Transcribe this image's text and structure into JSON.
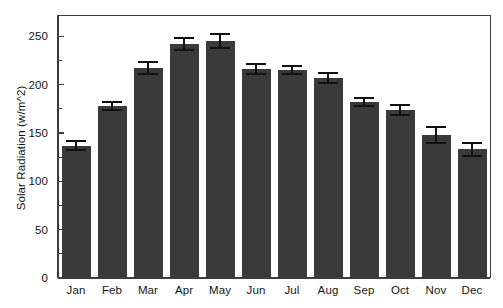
{
  "chart_data": {
    "type": "bar",
    "title": "",
    "xlabel": "",
    "ylabel": "Solar Radiation (w/m^2)",
    "categories": [
      "Jan",
      "Feb",
      "Mar",
      "Apr",
      "May",
      "Jun",
      "Jul",
      "Aug",
      "Sep",
      "Oct",
      "Nov",
      "Dec"
    ],
    "values": [
      137,
      178,
      217,
      242,
      245,
      216,
      215,
      207,
      182,
      174,
      148,
      133
    ],
    "errors": [
      5,
      4,
      6,
      6,
      7,
      5,
      4,
      5,
      4,
      5,
      8,
      7
    ],
    "ylim": [
      0,
      272
    ],
    "yticks": [
      0,
      50,
      100,
      150,
      200,
      250
    ],
    "ytick_labels": [
      "0",
      "50",
      "100",
      "150",
      "200",
      "250"
    ],
    "grid": false,
    "legend": null,
    "bar_color": "#3a3a3a",
    "errorbar_color": "#111111",
    "axis_color": "#3c3c3c",
    "background_color": "#ffffff",
    "series": [
      {
        "name": "Solar Radiation",
        "values": [
          137,
          178,
          217,
          242,
          245,
          216,
          215,
          207,
          182,
          174,
          148,
          133
        ],
        "errors": [
          5,
          4,
          6,
          6,
          7,
          5,
          4,
          5,
          4,
          5,
          8,
          7
        ]
      }
    ]
  },
  "figure": {
    "width": 503,
    "height": 308
  }
}
